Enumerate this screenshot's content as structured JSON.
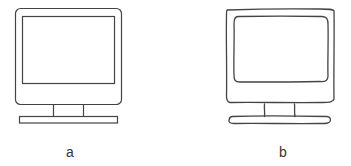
{
  "figure": {
    "panels": [
      {
        "id": "a",
        "label": "a",
        "style": "clean line drawing",
        "subject": "computer monitor"
      },
      {
        "id": "b",
        "label": "b",
        "style": "hand-drawn sketch",
        "subject": "computer monitor"
      }
    ],
    "stroke_color": "#444444",
    "background": "#ffffff"
  }
}
